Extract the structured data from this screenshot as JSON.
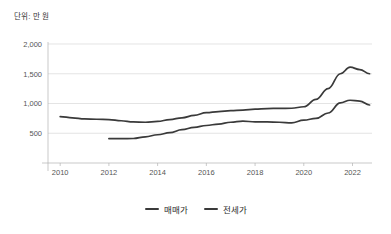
{
  "chart_data": {
    "type": "line",
    "title": "",
    "unit_note": "단위: 만 원",
    "xlabel": "",
    "ylabel": "",
    "xlim": [
      2009.5,
      2022.8
    ],
    "ylim": [
      0,
      2000
    ],
    "grid": true,
    "legend_position": "bottom",
    "x_ticks": [
      "2010",
      "2012",
      "2014",
      "2016",
      "2018",
      "2020",
      "2022"
    ],
    "x_tick_values": [
      2010,
      2012,
      2014,
      2016,
      2018,
      2020,
      2022
    ],
    "y_ticks": [
      "500",
      "1,000",
      "1,500",
      "2,000"
    ],
    "y_tick_values": [
      500,
      1000,
      1500,
      2000
    ],
    "series": [
      {
        "name": "매매가",
        "color": "#3a3a3a",
        "x": [
          2010.0,
          2010.5,
          2011.0,
          2011.5,
          2012.0,
          2012.5,
          2013.0,
          2013.5,
          2014.0,
          2014.5,
          2015.0,
          2015.5,
          2016.0,
          2016.5,
          2017.0,
          2017.5,
          2018.0,
          2018.5,
          2019.0,
          2019.5,
          2020.0,
          2020.5,
          2021.0,
          2021.5,
          2021.9,
          2022.3,
          2022.7
        ],
        "values": [
          780,
          760,
          740,
          735,
          730,
          710,
          690,
          685,
          700,
          730,
          760,
          800,
          845,
          865,
          880,
          890,
          905,
          915,
          918,
          920,
          945,
          1070,
          1250,
          1500,
          1610,
          1570,
          1500
        ]
      },
      {
        "name": "전세가",
        "color": "#3a3a3a",
        "x": [
          2012.0,
          2012.5,
          2013.0,
          2013.5,
          2014.0,
          2014.5,
          2015.0,
          2015.5,
          2016.0,
          2016.5,
          2017.0,
          2017.5,
          2018.0,
          2018.5,
          2019.0,
          2019.5,
          2020.0,
          2020.5,
          2021.0,
          2021.5,
          2021.9,
          2022.3,
          2022.7
        ],
        "values": [
          410,
          408,
          412,
          440,
          475,
          510,
          560,
          600,
          630,
          655,
          685,
          705,
          690,
          690,
          685,
          675,
          720,
          750,
          840,
          1010,
          1055,
          1040,
          975
        ]
      }
    ]
  },
  "legend": {
    "items": [
      {
        "label": "매매가",
        "color": "#3a3a3a"
      },
      {
        "label": "전세가",
        "color": "#3a3a3a"
      }
    ]
  }
}
